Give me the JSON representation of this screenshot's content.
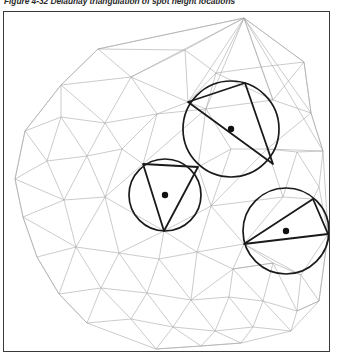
{
  "caption": {
    "text": "Figure 4-32 Delaunay triangulation of spot height locations",
    "figure_number": "4-32",
    "clipped": true
  },
  "figure": {
    "title": "Delaunay triangulation of spot height locations",
    "frame": {
      "x": 3,
      "y": 11,
      "width": 327,
      "height": 341,
      "stroke": "#3a3a3a"
    },
    "colors": {
      "mesh_line": "#a6a6a6",
      "highlight_line": "#1a1a1a",
      "circle_stroke": "#1a1a1a",
      "center_dot": "#111111",
      "background": "#ffffff",
      "frame_stroke": "#3a3a3a"
    },
    "circumcircles": [
      {
        "name": "top-circumcircle",
        "cx": 230,
        "cy": 128,
        "r": 48,
        "center_dot_r": 3.2
      },
      {
        "name": "left-circumcircle",
        "cx": 164,
        "cy": 194,
        "r": 36,
        "center_dot_r": 3.2
      },
      {
        "name": "right-circumcircle",
        "cx": 285,
        "cy": 230,
        "r": 43,
        "center_dot_r": 3.2
      }
    ],
    "highlight_triangles": [
      {
        "name": "top-triangle",
        "points": "187,101 244,82 272,163"
      },
      {
        "name": "left-triangle",
        "points": "142,163 197,166 163,230"
      },
      {
        "name": "right-triangle",
        "points": "243,243 312,198 327,233"
      }
    ],
    "vertices": [
      [
        243,
        17
      ],
      [
        97,
        48
      ],
      [
        184,
        49
      ],
      [
        60,
        84
      ],
      [
        130,
        76
      ],
      [
        215,
        72
      ],
      [
        260,
        66
      ],
      [
        303,
        61
      ],
      [
        24,
        130
      ],
      [
        60,
        116
      ],
      [
        104,
        122
      ],
      [
        156,
        113
      ],
      [
        187,
        101
      ],
      [
        244,
        82
      ],
      [
        205,
        108
      ],
      [
        272,
        99
      ],
      [
        310,
        112
      ],
      [
        322,
        150
      ],
      [
        14,
        178
      ],
      [
        46,
        160
      ],
      [
        86,
        155
      ],
      [
        121,
        148
      ],
      [
        142,
        163
      ],
      [
        197,
        166
      ],
      [
        230,
        148
      ],
      [
        266,
        140
      ],
      [
        296,
        151
      ],
      [
        318,
        186
      ],
      [
        22,
        216
      ],
      [
        63,
        199
      ],
      [
        104,
        196
      ],
      [
        163,
        230
      ],
      [
        210,
        205
      ],
      [
        243,
        243
      ],
      [
        282,
        196
      ],
      [
        312,
        198
      ],
      [
        327,
        233
      ],
      [
        36,
        256
      ],
      [
        75,
        246
      ],
      [
        118,
        252
      ],
      [
        158,
        258
      ],
      [
        196,
        251
      ],
      [
        232,
        268
      ],
      [
        272,
        262
      ],
      [
        300,
        274
      ],
      [
        325,
        263
      ],
      [
        58,
        293
      ],
      [
        100,
        287
      ],
      [
        146,
        292
      ],
      [
        190,
        299
      ],
      [
        228,
        296
      ],
      [
        262,
        300
      ],
      [
        296,
        310
      ],
      [
        318,
        300
      ],
      [
        86,
        322
      ],
      [
        130,
        318
      ],
      [
        172,
        326
      ],
      [
        214,
        330
      ],
      [
        252,
        326
      ],
      [
        290,
        330
      ],
      [
        155,
        348
      ],
      [
        200,
        345
      ],
      [
        240,
        342
      ]
    ],
    "mesh_edges_count": 178
  }
}
